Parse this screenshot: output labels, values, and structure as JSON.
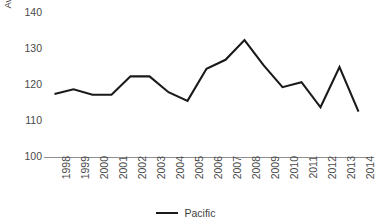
{
  "chart_data": {
    "type": "line",
    "title": "",
    "xlabel": "",
    "ylabel": "Avg. Annual Productivity (gC m-2y-1)",
    "ylabel_parts": {
      "main": "Avg. Annual Productivity (gC m",
      "sup1": "−2",
      "mid": "y",
      "sup2": "−1",
      "tail": ")"
    },
    "categories": [
      "1998",
      "1999",
      "2000",
      "2001",
      "2002",
      "2003",
      "2004",
      "2005",
      "2006",
      "2007",
      "2008",
      "2009",
      "2010",
      "2011",
      "2012",
      "2013",
      "2014"
    ],
    "series": [
      {
        "name": "Pacific",
        "color": "#1a1a1a",
        "values": [
          117.5,
          118.8,
          117.3,
          117.3,
          122.4,
          122.4,
          118.0,
          115.6,
          124.5,
          127.0,
          132.5,
          125.5,
          119.4,
          120.8,
          113.8,
          125.0,
          112.6
        ]
      }
    ],
    "ylim": [
      100,
      140
    ],
    "yticks": [
      100,
      110,
      120,
      130,
      140
    ],
    "ytick_labels": [
      "100",
      "110",
      "120",
      "130",
      "140"
    ],
    "grid": false,
    "legend_position": "bottom",
    "legend": [
      {
        "label": "Pacific",
        "color": "#1a1a1a"
      }
    ],
    "axis_color": "#8f8f8f",
    "text_color": "#4a4a4a"
  }
}
